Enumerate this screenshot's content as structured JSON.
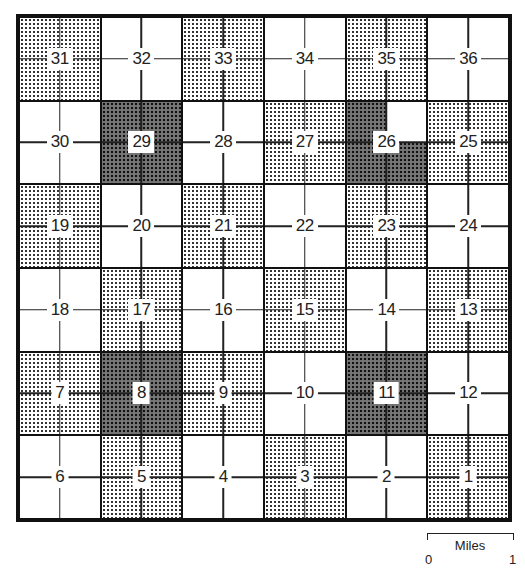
{
  "diagram": {
    "type": "township-section-grid",
    "rows": 6,
    "columns": 6,
    "sections": [
      [
        {
          "n": "31",
          "shade": "light"
        },
        {
          "n": "32",
          "shade": "none"
        },
        {
          "n": "33",
          "shade": "light"
        },
        {
          "n": "34",
          "shade": "none"
        },
        {
          "n": "35",
          "shade": "light"
        },
        {
          "n": "36",
          "shade": "none"
        }
      ],
      [
        {
          "n": "30",
          "shade": "none"
        },
        {
          "n": "29",
          "shade": "dark"
        },
        {
          "n": "28",
          "shade": "none"
        },
        {
          "n": "27",
          "shade": "light"
        },
        {
          "n": "26",
          "shade": "dark-except-ne-quarter"
        },
        {
          "n": "25",
          "shade": "light"
        }
      ],
      [
        {
          "n": "19",
          "shade": "light"
        },
        {
          "n": "20",
          "shade": "none"
        },
        {
          "n": "21",
          "shade": "light"
        },
        {
          "n": "22",
          "shade": "none"
        },
        {
          "n": "23",
          "shade": "light"
        },
        {
          "n": "24",
          "shade": "none"
        }
      ],
      [
        {
          "n": "18",
          "shade": "none"
        },
        {
          "n": "17",
          "shade": "light"
        },
        {
          "n": "16",
          "shade": "none"
        },
        {
          "n": "15",
          "shade": "light"
        },
        {
          "n": "14",
          "shade": "none"
        },
        {
          "n": "13",
          "shade": "light"
        }
      ],
      [
        {
          "n": "7",
          "shade": "light"
        },
        {
          "n": "8",
          "shade": "dark"
        },
        {
          "n": "9",
          "shade": "light"
        },
        {
          "n": "10",
          "shade": "none"
        },
        {
          "n": "11",
          "shade": "dark"
        },
        {
          "n": "12",
          "shade": "none"
        }
      ],
      [
        {
          "n": "6",
          "shade": "none"
        },
        {
          "n": "5",
          "shade": "light"
        },
        {
          "n": "4",
          "shade": "none"
        },
        {
          "n": "3",
          "shade": "light"
        },
        {
          "n": "2",
          "shade": "none"
        },
        {
          "n": "1",
          "shade": "light"
        }
      ]
    ]
  },
  "scale": {
    "title": "Miles",
    "start": "0",
    "end": "1"
  }
}
